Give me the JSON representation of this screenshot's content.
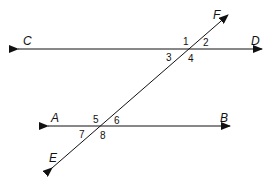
{
  "diagram": {
    "lines": [
      {
        "name": "CD",
        "endpoints": [
          "C",
          "D"
        ],
        "type": "line"
      },
      {
        "name": "AB",
        "endpoints": [
          "A",
          "B"
        ],
        "type": "line"
      },
      {
        "name": "EF",
        "endpoints": [
          "E",
          "F"
        ],
        "type": "transversal"
      }
    ],
    "points": {
      "C": "C",
      "D": "D",
      "A": "A",
      "B": "B",
      "E": "E",
      "F": "F"
    },
    "angles": {
      "a1": "1",
      "a2": "2",
      "a3": "3",
      "a4": "4",
      "a5": "5",
      "a6": "6",
      "a7": "7",
      "a8": "8"
    },
    "colors": {
      "stroke": "#111111",
      "background": "#ffffff"
    }
  }
}
